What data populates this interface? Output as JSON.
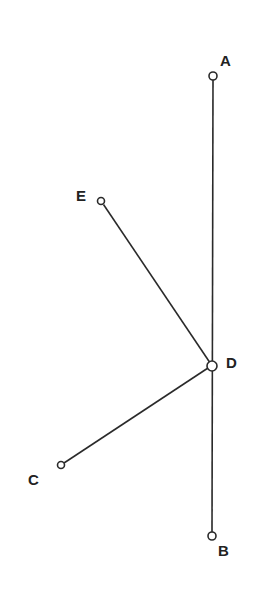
{
  "diagram": {
    "type": "geometry-lines",
    "line_color": "#2a2a2a",
    "points": [
      {
        "id": "A",
        "label": "A",
        "x": 213,
        "y": 76,
        "lx": 226,
        "ly": 66
      },
      {
        "id": "B",
        "label": "B",
        "x": 212,
        "y": 536,
        "lx": 224,
        "ly": 555
      },
      {
        "id": "C",
        "label": "C",
        "x": 61,
        "y": 465,
        "lx": 34,
        "ly": 485
      },
      {
        "id": "D",
        "label": "D",
        "x": 212,
        "y": 366,
        "lx": 232,
        "ly": 368
      },
      {
        "id": "E",
        "label": "E",
        "x": 101,
        "y": 201,
        "lx": 83,
        "ly": 201
      }
    ],
    "segments": [
      {
        "from": "A",
        "to": "B"
      },
      {
        "from": "E",
        "to": "D"
      },
      {
        "from": "C",
        "to": "D"
      }
    ]
  }
}
